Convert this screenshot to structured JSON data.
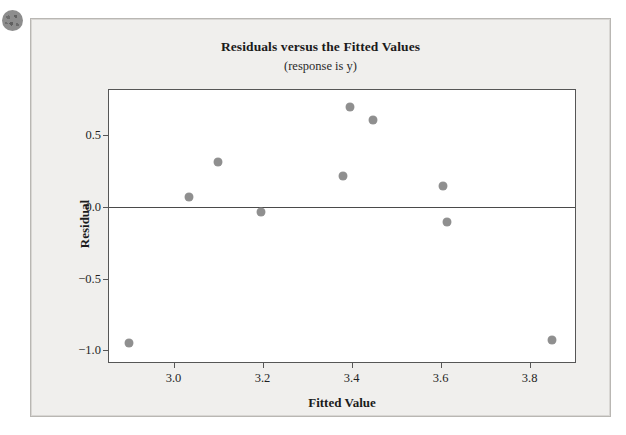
{
  "figure": {
    "corner_marker": "bullet-dot",
    "background_color": "#f0efed",
    "panel_border_color": "#b9b7b3"
  },
  "chart_data": {
    "type": "scatter",
    "title": "Residuals versus the Fitted Values",
    "subtitle": "(response is y)",
    "xlabel": "Fitted Value",
    "ylabel": "Residual",
    "xlim": [
      2.855,
      3.902
    ],
    "ylim": [
      -1.08,
      0.81
    ],
    "xticks": [
      3.0,
      3.2,
      3.4,
      3.6,
      3.8
    ],
    "xticklabels": [
      "3.0",
      "3.2",
      "3.4",
      "3.6",
      "3.8"
    ],
    "yticks": [
      0.5,
      0.0,
      -0.5,
      -1.0
    ],
    "yticklabels": [
      "0.5",
      "0.0",
      "−0.5",
      "−1.0"
    ],
    "grid": false,
    "legend": null,
    "reference_line": {
      "axis": "y",
      "value": 0.0,
      "color": "#4a4a4a"
    },
    "marker_color": "#8f8f8f",
    "points": [
      {
        "x": 2.9,
        "y": -0.95
      },
      {
        "x": 3.035,
        "y": 0.065
      },
      {
        "x": 3.1,
        "y": 0.31
      },
      {
        "x": 3.197,
        "y": -0.04
      },
      {
        "x": 3.38,
        "y": 0.215
      },
      {
        "x": 3.397,
        "y": 0.695
      },
      {
        "x": 3.449,
        "y": 0.6
      },
      {
        "x": 3.606,
        "y": 0.14
      },
      {
        "x": 3.614,
        "y": -0.105
      },
      {
        "x": 3.851,
        "y": -0.93
      }
    ]
  }
}
